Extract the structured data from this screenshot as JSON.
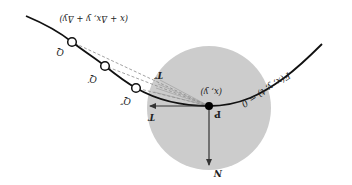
{
  "diagram": {
    "orientation": "rotated-180",
    "colors": {
      "background": "#ffffff",
      "disk": "#cccccc",
      "curve": "#111111",
      "arrow": "#333333",
      "dashed": "#888888",
      "point": "#000000"
    },
    "curve_label": "F(x, y, t) = 0",
    "point_label": "P",
    "point_coord_label": "(x, y)",
    "far_point_coord_label": "(x + Δx, y + Δy)",
    "tangent_label": "T",
    "secant_limit_label": "T′",
    "normal_label": "N",
    "sample_points": [
      {
        "label": "Q"
      },
      {
        "label": "Q′"
      },
      {
        "label": "Q″"
      }
    ]
  }
}
